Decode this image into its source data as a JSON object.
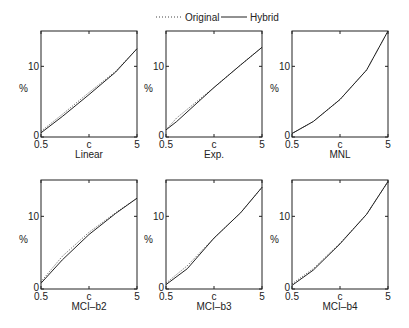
{
  "legend": {
    "original": "Original",
    "hybrid": "Hybrid"
  },
  "chart_data": [
    {
      "type": "line",
      "title": "",
      "xlabel": "Linear",
      "ylabel": "%",
      "xticks": [
        "0.5",
        "c",
        "5"
      ],
      "yticks": [
        "0",
        "10"
      ],
      "ylim": [
        0,
        15
      ],
      "series": [
        {
          "name": "Original",
          "style": "dotted",
          "x": [
            0.5,
            1.5,
            2.75,
            4,
            5
          ],
          "y": [
            0.8,
            3.2,
            6.3,
            9.3,
            12.5
          ]
        },
        {
          "name": "Hybrid",
          "style": "solid",
          "x": [
            0.5,
            1.5,
            2.75,
            4,
            5
          ],
          "y": [
            0.6,
            2.9,
            6.0,
            9.2,
            12.5
          ]
        }
      ]
    },
    {
      "type": "line",
      "title": "",
      "xlabel": "Exp.",
      "ylabel": "%",
      "xticks": [
        "0.5",
        "c",
        "5"
      ],
      "yticks": [
        "0",
        "10"
      ],
      "ylim": [
        0,
        15
      ],
      "series": [
        {
          "name": "Original",
          "style": "dotted",
          "x": [
            0.5,
            1.0,
            2.75,
            4,
            5
          ],
          "y": [
            1.0,
            2.7,
            7.0,
            10.2,
            12.7
          ]
        },
        {
          "name": "Hybrid",
          "style": "solid",
          "x": [
            0.5,
            1.0,
            2.75,
            4,
            5
          ],
          "y": [
            1.0,
            2.2,
            7.0,
            10.2,
            12.7
          ]
        }
      ]
    },
    {
      "type": "line",
      "title": "",
      "xlabel": "MNL",
      "ylabel": "%",
      "xticks": [
        "0.5",
        "c",
        "5"
      ],
      "yticks": [
        "0",
        "10"
      ],
      "ylim": [
        0,
        15
      ],
      "series": [
        {
          "name": "Original",
          "style": "dotted",
          "x": [
            0.5,
            1.5,
            2.75,
            4,
            5
          ],
          "y": [
            0.5,
            2.2,
            5.3,
            9.5,
            15.0
          ]
        },
        {
          "name": "Hybrid",
          "style": "solid",
          "x": [
            0.5,
            1.5,
            2.75,
            4,
            5
          ],
          "y": [
            0.5,
            2.2,
            5.3,
            9.5,
            15.0
          ]
        }
      ]
    },
    {
      "type": "line",
      "title": "",
      "xlabel": "MCI–b2",
      "ylabel": "%",
      "xticks": [
        "0.5",
        "c",
        "5"
      ],
      "yticks": [
        "0",
        "10"
      ],
      "ylim": [
        0,
        15
      ],
      "series": [
        {
          "name": "Original",
          "style": "dotted",
          "x": [
            0.5,
            1.5,
            2.75,
            4,
            5
          ],
          "y": [
            1.0,
            4.5,
            7.8,
            10.5,
            12.5
          ]
        },
        {
          "name": "Hybrid",
          "style": "solid",
          "x": [
            0.5,
            1.5,
            2.75,
            4,
            5
          ],
          "y": [
            0.8,
            4.0,
            7.5,
            10.4,
            12.5
          ]
        }
      ]
    },
    {
      "type": "line",
      "title": "",
      "xlabel": "MCI–b3",
      "ylabel": "%",
      "xticks": [
        "0.5",
        "c",
        "5"
      ],
      "yticks": [
        "0",
        "10"
      ],
      "ylim": [
        0,
        15
      ],
      "series": [
        {
          "name": "Original",
          "style": "dotted",
          "x": [
            0.5,
            1.5,
            2.75,
            4,
            5
          ],
          "y": [
            0.8,
            3.2,
            7.0,
            10.5,
            14.0
          ]
        },
        {
          "name": "Hybrid",
          "style": "solid",
          "x": [
            0.5,
            1.5,
            2.75,
            4,
            5
          ],
          "y": [
            0.6,
            2.8,
            7.0,
            10.5,
            14.0
          ]
        }
      ]
    },
    {
      "type": "line",
      "title": "",
      "xlabel": "MCI–b4",
      "ylabel": "%",
      "xticks": [
        "0.5",
        "c",
        "5"
      ],
      "yticks": [
        "0",
        "10"
      ],
      "ylim": [
        0,
        15
      ],
      "series": [
        {
          "name": "Original",
          "style": "dotted",
          "x": [
            0.5,
            1.5,
            2.75,
            4,
            5
          ],
          "y": [
            0.7,
            2.8,
            6.3,
            10.3,
            14.8
          ]
        },
        {
          "name": "Hybrid",
          "style": "solid",
          "x": [
            0.5,
            1.5,
            2.75,
            4,
            5
          ],
          "y": [
            0.5,
            2.6,
            6.2,
            10.3,
            14.8
          ]
        }
      ]
    }
  ]
}
